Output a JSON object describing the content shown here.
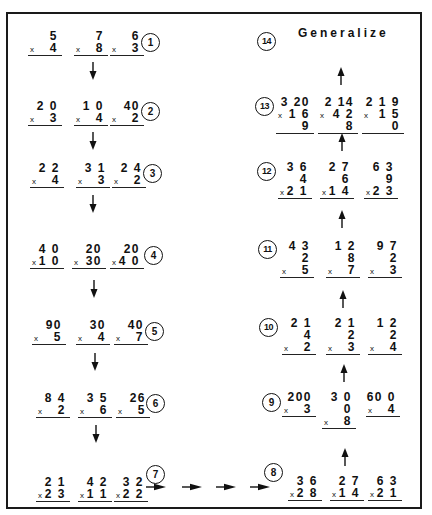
{
  "title": "Generalize",
  "steps": {
    "s1": {
      "label": "1",
      "problems": [
        {
          "top": "5",
          "bottom": "4"
        },
        {
          "top": "7",
          "bottom": "8"
        },
        {
          "top": "6",
          "bottom": "3"
        }
      ]
    },
    "s2": {
      "label": "2",
      "problems": [
        {
          "top": "2 0",
          "bottom": "3"
        },
        {
          "top": "1 0",
          "bottom": "4"
        },
        {
          "top": "40",
          "bottom": "2"
        }
      ]
    },
    "s3": {
      "label": "3",
      "problems": [
        {
          "top": "2 2",
          "bottom": "4"
        },
        {
          "top": "3 1",
          "bottom": "3"
        },
        {
          "top": "2 4",
          "bottom": "2"
        }
      ]
    },
    "s4": {
      "label": "4",
      "problems": [
        {
          "top": "4 0",
          "bottom": "1 0"
        },
        {
          "top": "20",
          "bottom": "30"
        },
        {
          "top": "20",
          "bottom": "4 0"
        }
      ]
    },
    "s5": {
      "label": "5",
      "problems": [
        {
          "top": "90",
          "bottom": "5"
        },
        {
          "top": "30",
          "bottom": "4"
        },
        {
          "top": "40",
          "bottom": "7"
        }
      ]
    },
    "s6": {
      "label": "6",
      "problems": [
        {
          "top": "8 4",
          "bottom": "2"
        },
        {
          "top": "3 5",
          "bottom": "6"
        },
        {
          "top": "26",
          "bottom": "5"
        }
      ]
    },
    "s7": {
      "label": "7",
      "problems": [
        {
          "top": "2 1",
          "bottom": "2 3"
        },
        {
          "top": "4 2",
          "bottom": "1 1"
        },
        {
          "top": "3 2",
          "bottom": "2 2"
        }
      ]
    },
    "s8": {
      "label": "8",
      "problems": [
        {
          "top": "3 6",
          "bottom": "2 8"
        },
        {
          "top": "2 7",
          "bottom": "1 4"
        },
        {
          "top": "6 3",
          "bottom": "2 1"
        }
      ]
    },
    "s9": {
      "label": "9",
      "problems": [
        {
          "top": "200",
          "bottom": "3"
        },
        {
          "top": "3 0 0",
          "bottom": "8"
        },
        {
          "top": "60 0",
          "bottom": "4"
        }
      ]
    },
    "s10": {
      "label": "10",
      "problems": [
        {
          "top": "2 1 4",
          "bottom": "2"
        },
        {
          "top": "2 1 2",
          "bottom": "3"
        },
        {
          "top": "1 2 2",
          "bottom": "4"
        }
      ]
    },
    "s11": {
      "label": "11",
      "problems": [
        {
          "top": "4 3 2",
          "bottom": "5"
        },
        {
          "top": "1 2 8",
          "bottom": "7"
        },
        {
          "top": "9 7 2",
          "bottom": "3"
        }
      ]
    },
    "s12": {
      "label": "12",
      "problems": [
        {
          "top": "3 6 4",
          "bottom": "2 1"
        },
        {
          "top": "2 7 6",
          "bottom": "1 4"
        },
        {
          "top": "6 3 9",
          "bottom": "2 3"
        }
      ]
    },
    "s13": {
      "label": "13",
      "problems": [
        {
          "top": "3 20",
          "bottom": "1 6 9"
        },
        {
          "top": "2 14",
          "bottom": "4 2 8"
        },
        {
          "top": "2 1 9",
          "bottom": "1 5 0"
        }
      ]
    },
    "s14": {
      "label": "14"
    }
  },
  "times_symbol": "x"
}
